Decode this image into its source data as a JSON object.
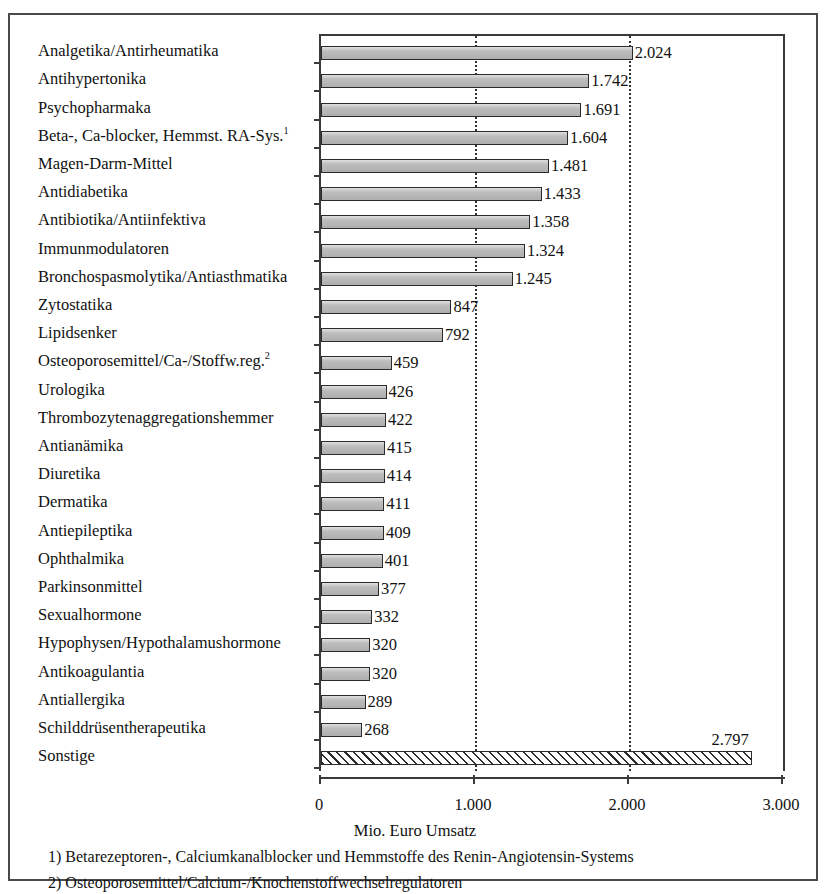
{
  "chart_data": {
    "type": "bar",
    "orientation": "horizontal",
    "title": "",
    "xlabel": "Mio. Euro Umsatz",
    "ylabel": "",
    "xlim": [
      0,
      3000
    ],
    "xticks": [
      0,
      1000,
      2000,
      3000
    ],
    "xtick_labels": [
      "0",
      "1.000",
      "2.000",
      "3.000"
    ],
    "grid": "vertical dotted at 1.000 and 2.000",
    "legend": "none",
    "categories": [
      "Analgetika/Antirheumatika",
      "Antihypertonika",
      "Psychopharmaka",
      "Beta-, Ca-blocker, Hemmst. RA-Sys.",
      "Magen-Darm-Mittel",
      "Antidiabetika",
      "Antibiotika/Antiinfektiva",
      "Immunmodulatoren",
      "Bronchospasmolytika/Antiasthmatika",
      "Zytostatika",
      "Lipidsenker",
      "Osteoporosemittel/Ca-/Stoffw.reg.",
      "Urologika",
      "Thrombozytenaggregationshemmer",
      "Antianämika",
      "Diuretika",
      "Dermatika",
      "Antiepileptika",
      "Ophthalmika",
      "Parkinsonmittel",
      "Sexualhormone",
      "Hypophysen/Hypothalamushormone",
      "Antikoagulantia",
      "Antiallergika",
      "Schilddrüsentherapeutika",
      "Sonstige"
    ],
    "category_footnote_markers": {
      "3": "1",
      "11": "2"
    },
    "values": [
      2024,
      1742,
      1691,
      1604,
      1481,
      1433,
      1358,
      1324,
      1245,
      847,
      792,
      459,
      426,
      422,
      415,
      414,
      411,
      409,
      401,
      377,
      332,
      320,
      320,
      289,
      268,
      2797
    ],
    "value_labels": [
      "2.024",
      "1.742",
      "1.691",
      "1.604",
      "1.481",
      "1.433",
      "1.358",
      "1.324",
      "1.245",
      "847",
      "792",
      "459",
      "426",
      "422",
      "415",
      "414",
      "411",
      "409",
      "401",
      "377",
      "332",
      "320",
      "320",
      "289",
      "268",
      "2.797"
    ]
  },
  "footnotes": {
    "note_1": "1) Betarezeptoren-, Calciumkanalblocker und Hemmstoffe des Renin-Angiotensin-Systems",
    "note_2": "2) Osteoporosemittel/Calcium-/Knochenstoffwechselregulatoren"
  },
  "style": {
    "bar_fill": "#b9b9b9",
    "bar_border": "#2b2b2b",
    "hatched_bar_fill": "#ffffff",
    "axis_color": "#3a3a3a",
    "frame_color": "#4a4a4a",
    "text_color": "#111111"
  }
}
